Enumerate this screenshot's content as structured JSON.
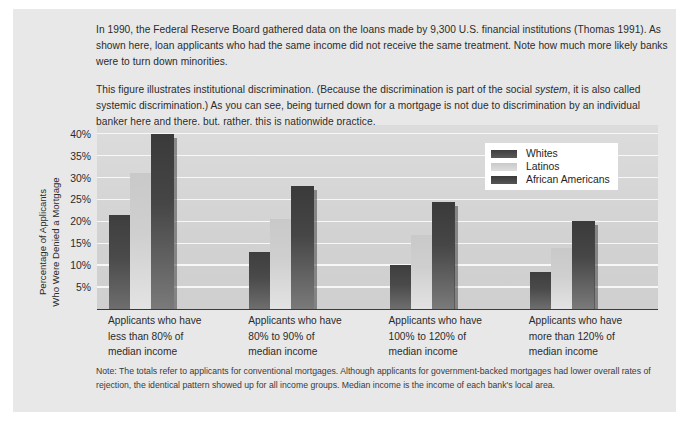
{
  "figure": {
    "intro_paragraphs": [
      "In 1990, the Federal Reserve Board gathered data on the loans made by 9,300 U.S. financial institutions (Thomas 1991). As shown here, loan applicants who had the same income did not receive the same treatment. Note how much more likely banks were to turn down minorities.",
      "This figure illustrates institutional discrimination. (Because the discrimination is part of the social system, it is also called systemic discrimination.) As you can see, being turned down for a mortgage is not due to discrimination by an individual banker here and there, but, rather, this is nationwide practice."
    ],
    "note": "Note:  The totals refer to applicants for conventional mortgages. Although applicants for government-backed mortgages had lower overall rates of rejection, the identical pattern showed up for all income groups. Median income is the income of each bank's local area."
  },
  "chart_data": {
    "type": "bar",
    "title": "",
    "xlabel": "",
    "ylabel": "Percentage of Applicants Who Were Denied a Mortgage",
    "ylabel_lines": [
      "Percentage of Applicants",
      "Who Were Denied a Mortgage"
    ],
    "ylim": [
      0,
      42
    ],
    "ytick_values": [
      40,
      35,
      30,
      25,
      20,
      15,
      10,
      5
    ],
    "ytick_labels": [
      "40%",
      "35%",
      "30%",
      "25%",
      "20%",
      "15%",
      "10%",
      "5%"
    ],
    "grid": true,
    "legend_position": "upper-right-inside",
    "categories": [
      "Applicants who have less than 80% of median income",
      "Applicants who have 80% to 90% of median income",
      "Applicants who have 100% to 120% of median income",
      "Applicants who have more than 120% of median income"
    ],
    "category_lines": [
      [
        "Applicants who have",
        "less than 80% of",
        "median income"
      ],
      [
        "Applicants who have",
        "80% to 90% of",
        "median income"
      ],
      [
        "Applicants who have",
        "100% to 120% of",
        "median income"
      ],
      [
        "Applicants who have",
        "more than 120% of",
        "median income"
      ]
    ],
    "series": [
      {
        "name": "Whites",
        "color": "#4a4a4a",
        "values": [
          21.5,
          13.0,
          10.0,
          8.5
        ]
      },
      {
        "name": "Latinos",
        "color": "#cfcfcf",
        "values": [
          31.0,
          20.5,
          17.0,
          14.0
        ]
      },
      {
        "name": "African Americans",
        "color": "#3f3f3f",
        "values": [
          40.0,
          28.0,
          24.5,
          20.0
        ]
      }
    ]
  }
}
